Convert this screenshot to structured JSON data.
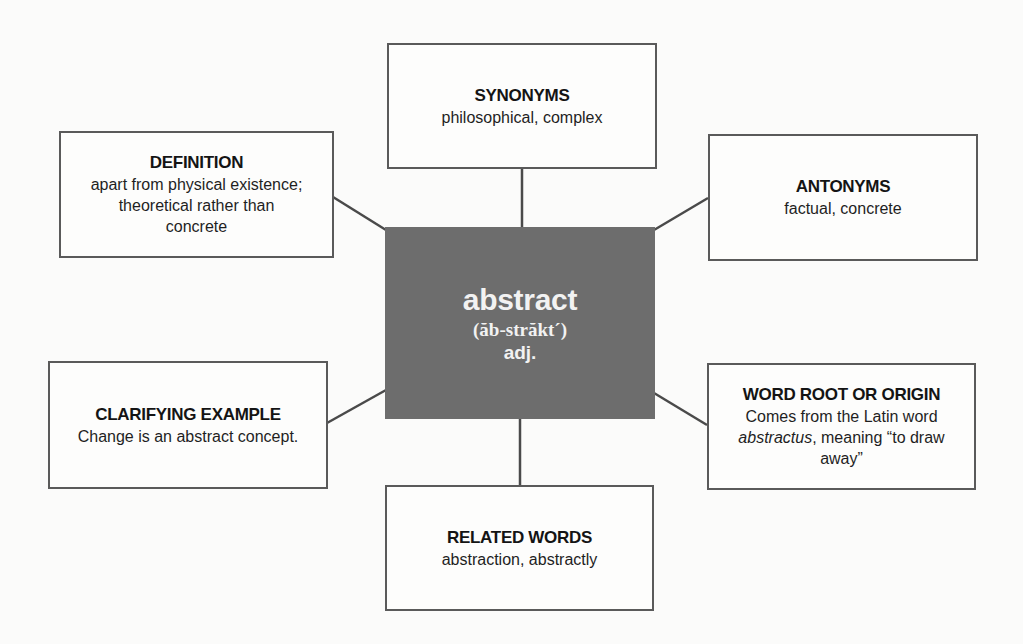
{
  "center": {
    "word": "abstract",
    "pronunciation": "(ăb-străkt´)",
    "part_of_speech": "adj.",
    "fill_color": "#6d6d6d"
  },
  "boxes": {
    "synonyms": {
      "heading": "SYNONYMS",
      "text": "philosophical, complex"
    },
    "definition": {
      "heading": "DEFINITION",
      "lines": [
        "apart from physical existence;",
        "theoretical rather than",
        "concrete"
      ]
    },
    "antonyms": {
      "heading": "ANTONYMS",
      "text": "factual, concrete"
    },
    "clarifying_example": {
      "heading": "CLARIFYING EXAMPLE",
      "text": "Change is an abstract concept."
    },
    "word_root": {
      "heading": "WORD ROOT OR ORIGIN",
      "line1": "Comes from the Latin word",
      "italic_word": "abstractus",
      "line2_rest": ", meaning “to draw",
      "line3": "away”"
    },
    "related_words": {
      "heading": "RELATED WORDS",
      "text": "abstraction, abstractly"
    }
  },
  "colors": {
    "border": "#5a5a5a",
    "connector": "#4a4a4a",
    "background": "#fbfbfa"
  }
}
